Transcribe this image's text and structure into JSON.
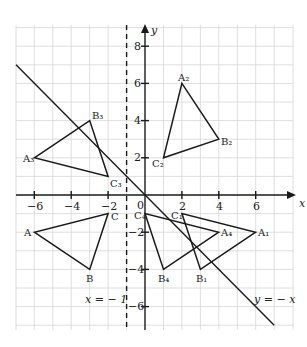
{
  "colors": {
    "grid": "#d6d6d6",
    "axis": "#1a1a1a",
    "shape": "#1a1a1a",
    "background": "#ffffff"
  },
  "axes": {
    "x_label": "x",
    "y_label": "y",
    "origin_label": "0",
    "x_ticks": [
      {
        "value": -6,
        "label": "−6"
      },
      {
        "value": -4,
        "label": "−4"
      },
      {
        "value": -2,
        "label": "−2"
      },
      {
        "value": 2,
        "label": "2"
      },
      {
        "value": 4,
        "label": "4"
      },
      {
        "value": 6,
        "label": "6"
      }
    ],
    "y_ticks": [
      {
        "value": 8,
        "label": "8"
      },
      {
        "value": 6,
        "label": "6"
      },
      {
        "value": 4,
        "label": "4"
      },
      {
        "value": 2,
        "label": "2"
      },
      {
        "value": -2,
        "label": "−2"
      },
      {
        "value": -4,
        "label": "−4"
      },
      {
        "value": -6,
        "label": "−6"
      }
    ]
  },
  "lines": {
    "mirror_vertical": {
      "label": "x = − 1",
      "x": -1
    },
    "mirror_diagonal": {
      "label": "y = − x"
    }
  },
  "triangles": [
    {
      "name": "ABC",
      "points": [
        {
          "label": "A",
          "x": -6,
          "y": -2
        },
        {
          "label": "B",
          "x": -3,
          "y": -4
        },
        {
          "label": "C",
          "x": -2,
          "y": -1
        }
      ]
    },
    {
      "name": "A1B1C1",
      "points": [
        {
          "label": "A₁",
          "x": 6,
          "y": -2
        },
        {
          "label": "B₁",
          "x": 3,
          "y": -4
        },
        {
          "label": "C₁",
          "x": 2,
          "y": -1
        }
      ]
    },
    {
      "name": "A2B2C2",
      "points": [
        {
          "label": "A₂",
          "x": 2,
          "y": 6
        },
        {
          "label": "B₂",
          "x": 4,
          "y": 3
        },
        {
          "label": "C₂",
          "x": 1,
          "y": 2
        }
      ]
    },
    {
      "name": "A3B3C3",
      "points": [
        {
          "label": "A₃",
          "x": -6,
          "y": 2
        },
        {
          "label": "B₃",
          "x": -3,
          "y": 4
        },
        {
          "label": "C₃",
          "x": -2,
          "y": 1
        }
      ]
    },
    {
      "name": "A4B4C4",
      "points": [
        {
          "label": "A₄",
          "x": 4,
          "y": -2
        },
        {
          "label": "B₄",
          "x": 1,
          "y": -4
        },
        {
          "label": "C₄",
          "x": 0,
          "y": -1
        }
      ]
    }
  ]
}
